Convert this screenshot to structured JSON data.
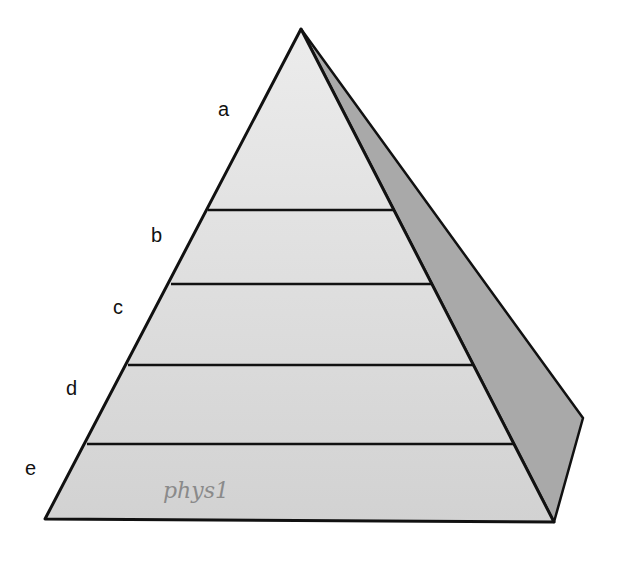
{
  "diagram": {
    "type": "pyramid",
    "levels": [
      {
        "label": "a"
      },
      {
        "label": "b"
      },
      {
        "label": "c"
      },
      {
        "label": "d"
      },
      {
        "label": "e"
      }
    ],
    "handwritten_note": "phys1",
    "colors": {
      "front_face": "#dcdcdc",
      "side_face": "#a8a8a8",
      "outline": "#111111"
    }
  }
}
